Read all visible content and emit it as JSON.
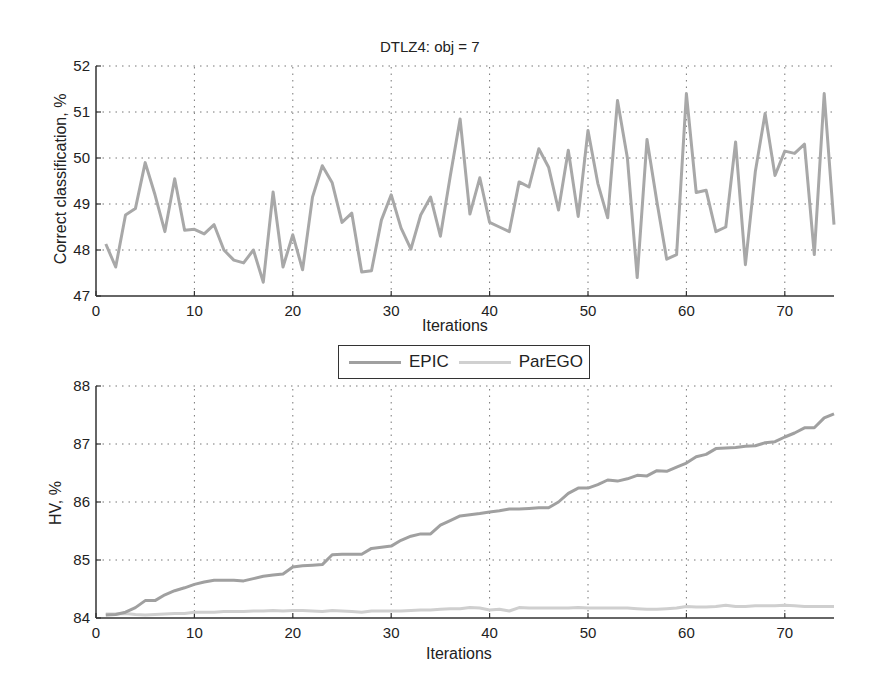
{
  "chart_data": [
    {
      "type": "line",
      "title": "DTLZ4: obj = 7",
      "xlabel": "Iterations",
      "ylabel": "Correct classification, %",
      "xlim": [
        0,
        75
      ],
      "ylim": [
        47,
        52
      ],
      "xticks": [
        0,
        10,
        20,
        30,
        40,
        50,
        60,
        70
      ],
      "yticks": [
        47,
        48,
        49,
        50,
        51,
        52
      ],
      "grid": true,
      "x": [
        1,
        2,
        3,
        4,
        5,
        6,
        7,
        8,
        9,
        10,
        11,
        12,
        13,
        14,
        15,
        16,
        17,
        18,
        19,
        20,
        21,
        22,
        23,
        24,
        25,
        26,
        27,
        28,
        29,
        30,
        31,
        32,
        33,
        34,
        35,
        36,
        37,
        38,
        39,
        40,
        41,
        42,
        43,
        44,
        45,
        46,
        47,
        48,
        49,
        50,
        51,
        52,
        53,
        54,
        55,
        56,
        57,
        58,
        59,
        60,
        61,
        62,
        63,
        64,
        65,
        66,
        67,
        68,
        69,
        70,
        71,
        72,
        73,
        74,
        75
      ],
      "series": [
        {
          "name": "Correct classification",
          "color": "#a8a8a8",
          "values": [
            48.13,
            47.63,
            48.76,
            48.9,
            49.9,
            49.2,
            48.4,
            49.55,
            48.43,
            48.45,
            48.35,
            48.55,
            48.0,
            47.78,
            47.72,
            48.0,
            47.3,
            49.26,
            47.63,
            48.33,
            47.57,
            49.15,
            49.83,
            49.46,
            48.6,
            48.8,
            47.52,
            47.55,
            48.65,
            49.2,
            48.48,
            48.02,
            48.76,
            49.15,
            48.3,
            49.6,
            50.85,
            48.78,
            49.57,
            48.6,
            48.5,
            48.4,
            49.48,
            49.37,
            50.2,
            49.8,
            48.87,
            50.17,
            48.73,
            50.6,
            49.45,
            48.7,
            51.25,
            50.0,
            47.4,
            50.4,
            49.05,
            47.8,
            47.9,
            51.4,
            49.25,
            49.3,
            48.4,
            48.5,
            50.35,
            47.68,
            49.7,
            50.97,
            49.62,
            50.15,
            50.1,
            50.3,
            47.9,
            51.4,
            48.55
          ]
        }
      ]
    },
    {
      "type": "line",
      "title": "",
      "xlabel": "Iterations",
      "ylabel": "HV, %",
      "xlim": [
        0,
        75
      ],
      "ylim": [
        84,
        88
      ],
      "xticks": [
        0,
        10,
        20,
        30,
        40,
        50,
        60,
        70
      ],
      "yticks": [
        84,
        85,
        86,
        87,
        88
      ],
      "grid": true,
      "legend": {
        "position": "top-center-outside",
        "entries": [
          "EPIC",
          "ParEGO"
        ]
      },
      "x": [
        1,
        2,
        3,
        4,
        5,
        6,
        7,
        8,
        9,
        10,
        11,
        12,
        13,
        14,
        15,
        16,
        17,
        18,
        19,
        20,
        21,
        22,
        23,
        24,
        25,
        26,
        27,
        28,
        29,
        30,
        31,
        32,
        33,
        34,
        35,
        36,
        37,
        38,
        39,
        40,
        41,
        42,
        43,
        44,
        45,
        46,
        47,
        48,
        49,
        50,
        51,
        52,
        53,
        54,
        55,
        56,
        57,
        58,
        59,
        60,
        61,
        62,
        63,
        64,
        65,
        66,
        67,
        68,
        69,
        70,
        71,
        72,
        73,
        74,
        75
      ],
      "series": [
        {
          "name": "EPIC",
          "color": "#a0a0a0",
          "values": [
            84.05,
            84.06,
            84.1,
            84.18,
            84.3,
            84.3,
            84.4,
            84.47,
            84.52,
            84.58,
            84.62,
            84.65,
            84.65,
            84.65,
            84.64,
            84.68,
            84.72,
            84.74,
            84.76,
            84.88,
            84.9,
            84.91,
            84.92,
            85.09,
            85.1,
            85.1,
            85.1,
            85.2,
            85.22,
            85.24,
            85.34,
            85.41,
            85.45,
            85.45,
            85.6,
            85.68,
            85.76,
            85.78,
            85.8,
            85.83,
            85.85,
            85.88,
            85.88,
            85.89,
            85.9,
            85.9,
            86.0,
            86.15,
            86.24,
            86.24,
            86.3,
            86.38,
            86.36,
            86.4,
            86.46,
            86.45,
            86.54,
            86.53,
            86.6,
            86.67,
            86.78,
            86.82,
            86.92,
            86.93,
            86.94,
            86.96,
            86.97,
            87.02,
            87.04,
            87.12,
            87.19,
            87.28,
            87.28,
            87.45,
            87.52
          ]
        },
        {
          "name": "ParEGO",
          "color": "#cfcfcf",
          "values": [
            84.07,
            84.07,
            84.08,
            84.06,
            84.05,
            84.06,
            84.07,
            84.08,
            84.08,
            84.1,
            84.1,
            84.1,
            84.11,
            84.11,
            84.11,
            84.12,
            84.12,
            84.13,
            84.12,
            84.13,
            84.13,
            84.12,
            84.11,
            84.13,
            84.12,
            84.11,
            84.1,
            84.12,
            84.12,
            84.12,
            84.12,
            84.13,
            84.14,
            84.14,
            84.15,
            84.16,
            84.16,
            84.18,
            84.17,
            84.14,
            84.15,
            84.12,
            84.18,
            84.17,
            84.17,
            84.17,
            84.17,
            84.17,
            84.18,
            84.17,
            84.17,
            84.17,
            84.17,
            84.17,
            84.16,
            84.15,
            84.15,
            84.16,
            84.17,
            84.2,
            84.19,
            84.19,
            84.2,
            84.22,
            84.2,
            84.2,
            84.21,
            84.21,
            84.21,
            84.22,
            84.21,
            84.2,
            84.2,
            84.2,
            84.2
          ]
        }
      ]
    }
  ]
}
